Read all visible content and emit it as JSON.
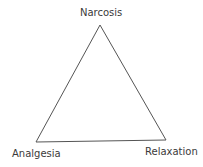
{
  "diagram": {
    "type": "triangle",
    "vertices": {
      "top": "Narcosis",
      "bottom_left": "Analgesia",
      "bottom_right": "Relaxation"
    },
    "line_color": "#555555"
  }
}
